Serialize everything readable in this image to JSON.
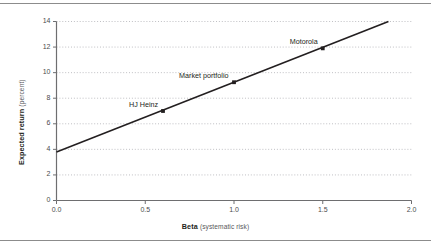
{
  "figure": {
    "has_top_rule": true,
    "has_bottom_rule": true,
    "background": "#ffffff"
  },
  "chart_data": {
    "type": "line",
    "title": "",
    "xlabel": "Beta",
    "xlabel_unit": "(systematic risk)",
    "ylabel": "Expected return",
    "ylabel_unit": "(percent)",
    "xlim": [
      0.0,
      2.0
    ],
    "ylim": [
      0,
      14
    ],
    "xticks": [
      0.0,
      0.5,
      1.0,
      1.5,
      2.0
    ],
    "xtick_labels": [
      "0.0",
      "0.5",
      "1.0",
      "1.5",
      "2.0"
    ],
    "yticks": [
      0,
      2,
      4,
      6,
      8,
      10,
      12,
      14
    ],
    "ytick_labels": [
      "0",
      "2",
      "4",
      "6",
      "8",
      "10",
      "12",
      "14"
    ],
    "grid": "horizontal-dotted",
    "grid_color": "#b9b9bd",
    "legend": "none",
    "line_color": "#231f20",
    "series": [
      {
        "name": "Security market line",
        "x": [
          0.0,
          1.87
        ],
        "values": [
          3.8,
          14.0
        ]
      }
    ],
    "points": [
      {
        "label": "HJ Heinz",
        "x": 0.6,
        "y": 7.0,
        "label_position": "above-left"
      },
      {
        "label": "Market portfolio",
        "x": 1.0,
        "y": 9.25,
        "label_position": "above-left"
      },
      {
        "label": "Motorola",
        "x": 1.5,
        "y": 11.9,
        "label_position": "above-left"
      }
    ]
  }
}
